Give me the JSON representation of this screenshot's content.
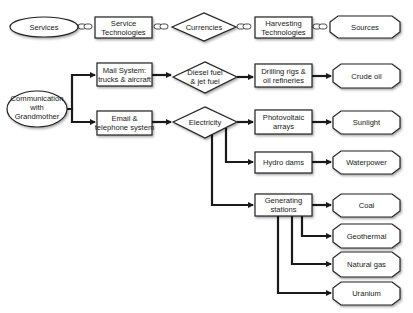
{
  "diagram": {
    "legend_row": {
      "services": "Services",
      "service_tech": [
        "Service",
        "Technologies"
      ],
      "currencies": "Currencies",
      "harvesting_tech": [
        "Harvesting",
        "Technologies"
      ],
      "sources": "Sources"
    },
    "service": [
      "Communication",
      "with",
      "Grandmother"
    ],
    "technologies": {
      "mail": [
        "Mail System:",
        "trucks & aircraft"
      ],
      "email": [
        "Email &",
        "telephone system"
      ]
    },
    "currencies": {
      "diesel": [
        "Diesel fuel",
        "& jet fuel"
      ],
      "electricity": "Electricity"
    },
    "harvesting": {
      "drilling": [
        "Drilling rigs &",
        "oil refineries"
      ],
      "photovoltaic": [
        "Photovoltaic",
        "arrays"
      ],
      "hydro": "Hydro dams",
      "generating": [
        "Generating",
        "stations"
      ]
    },
    "sources": {
      "crude_oil": "Crude oil",
      "sunlight": "Sunlight",
      "waterpower": "Waterpower",
      "coal": "Coal",
      "geothermal": "Geothermal",
      "natural_gas": "Natural gas",
      "uranium": "Uranium"
    }
  }
}
